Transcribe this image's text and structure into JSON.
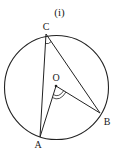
{
  "figure": {
    "caption": "(i)",
    "points": {
      "C": {
        "label": "C",
        "x": 46,
        "y": 34
      },
      "O": {
        "label": "O",
        "x": 56,
        "y": 86
      },
      "A": {
        "label": "A",
        "x": 40,
        "y": 137
      },
      "B": {
        "label": "B",
        "x": 100,
        "y": 113
      }
    },
    "circle": {
      "cx": 56.5,
      "cy": 87.5,
      "r": 52
    },
    "stroke_color": "#222222"
  }
}
